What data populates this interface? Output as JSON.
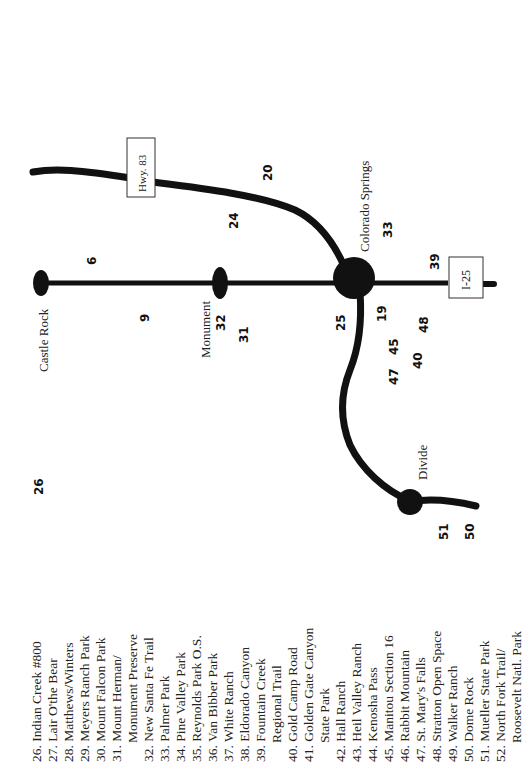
{
  "map": {
    "orientation": "rotated 90 degrees counter-clockwise",
    "colors": {
      "road": "#111111",
      "background": "#ffffff",
      "text": "#222222"
    },
    "cities": [
      {
        "name": "Castle Rock"
      },
      {
        "name": "Monument"
      },
      {
        "name": "Colorado Springs"
      },
      {
        "name": "Divide"
      }
    ],
    "highways": [
      {
        "label": "Hwy. 83"
      },
      {
        "label": "I-25"
      }
    ],
    "markers": [
      "26",
      "6",
      "9",
      "32",
      "31",
      "24",
      "20",
      "25",
      "19",
      "33",
      "39",
      "45",
      "47",
      "40",
      "48",
      "51",
      "50"
    ]
  },
  "legend": {
    "items": [
      {
        "num": "26.",
        "label": "Indian Creek #800"
      },
      {
        "num": "27.",
        "label": "Lair O'the Bear"
      },
      {
        "num": "28.",
        "label": "Matthews/Winters"
      },
      {
        "num": "29.",
        "label": "Meyers Ranch Park"
      },
      {
        "num": "30.",
        "label": "Mount Falcon Park"
      },
      {
        "num": "31.",
        "label": "Mount Herman/"
      },
      {
        "num": "",
        "label": "Monument Preserve"
      },
      {
        "num": "32.",
        "label": "New Santa Fe Trail"
      },
      {
        "num": "33.",
        "label": "Palmer Park"
      },
      {
        "num": "34.",
        "label": "Pine Valley Park"
      },
      {
        "num": "35.",
        "label": "Reynolds Park O.S."
      },
      {
        "num": "36.",
        "label": "Van Bibber Park"
      },
      {
        "num": "37.",
        "label": "White Ranch"
      },
      {
        "num": "38.",
        "label": "Eldorado Canyon"
      },
      {
        "num": "39.",
        "label": "Fountain Creek"
      },
      {
        "num": "",
        "label": "Regional Trail"
      },
      {
        "num": "40.",
        "label": "Gold Camp Road"
      },
      {
        "num": "41.",
        "label": "Golden Gate Canyon"
      },
      {
        "num": "",
        "label": "State Park"
      },
      {
        "num": "42.",
        "label": "Hall Ranch"
      },
      {
        "num": "43.",
        "label": "Heil Valley Ranch"
      },
      {
        "num": "44.",
        "label": "Kenosha Pass"
      },
      {
        "num": "45.",
        "label": "Manitou Section 16"
      },
      {
        "num": "46.",
        "label": "Rabbit Mountain"
      },
      {
        "num": "47.",
        "label": "St. Mary's Falls"
      },
      {
        "num": "48.",
        "label": "Stratton Open Space"
      },
      {
        "num": "49.",
        "label": "Walker Ranch"
      },
      {
        "num": "50.",
        "label": "Dome Rock"
      },
      {
        "num": "51.",
        "label": "Mueller State Park"
      },
      {
        "num": "52.",
        "label": "North Fork Trail/"
      },
      {
        "num": "",
        "label": "Roosevelt Natl. Park"
      }
    ]
  }
}
